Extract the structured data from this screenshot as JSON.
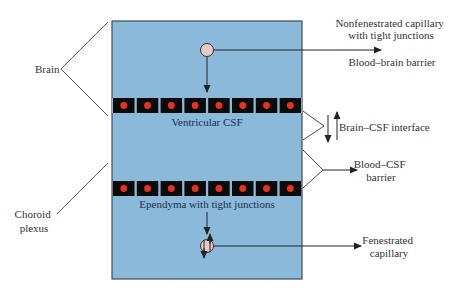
{
  "colors": {
    "box_fill": "#8ab9d9",
    "box_stroke": "#3c4e5e",
    "cell_fill": "#0b0b0b",
    "nucleus": "#e8321e",
    "capillary_fill": "#e6c9c9",
    "line": "#222222"
  },
  "labels": {
    "brain": "Brain",
    "choroid_plexus_line1": "Choroid",
    "choroid_plexus_line2": "plexus",
    "nonfenestrated_line1": "Nonfenestrated capillary",
    "nonfenestrated_line2": "with tight junctions",
    "blood_brain_barrier": "Blood–brain barrier",
    "ventricular_csf": "Ventricular CSF",
    "brain_csf_interface": "Brain–CSF interface",
    "blood_csf_line1": "Blood–CSF",
    "blood_csf_line2": "barrier",
    "ependyma": "Ependyma with tight junctions",
    "fenestrated_line1": "Fenestrated",
    "fenestrated_line2": "capillary"
  },
  "structure": {
    "upper_cell_row_count": 8,
    "lower_cell_row_count": 8
  }
}
